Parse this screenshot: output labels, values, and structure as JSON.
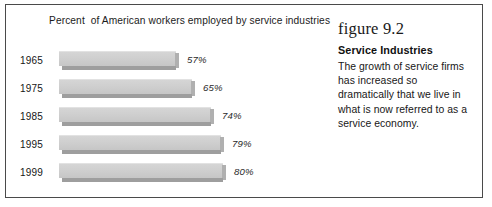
{
  "figure": {
    "number_label": "figure 9.2",
    "heading": "Service Industries",
    "body": "The growth of service firms has increased so dramatically that we live in what is now referred to as a service economy."
  },
  "chart_data": {
    "type": "bar",
    "orientation": "horizontal",
    "title": "Percent  of American workers employed by service industries",
    "xlabel": "",
    "ylabel": "",
    "categories": [
      "1965",
      "1975",
      "1985",
      "1995",
      "1999"
    ],
    "values": [
      57,
      65,
      74,
      79,
      80
    ],
    "value_labels": [
      "57%",
      "65%",
      "74%",
      "79%",
      "80%"
    ],
    "xlim": [
      0,
      100
    ],
    "grid": false,
    "legend": null,
    "bar_color": "#cfcfcf",
    "bar_shadow_color": "#9e9e9e"
  }
}
